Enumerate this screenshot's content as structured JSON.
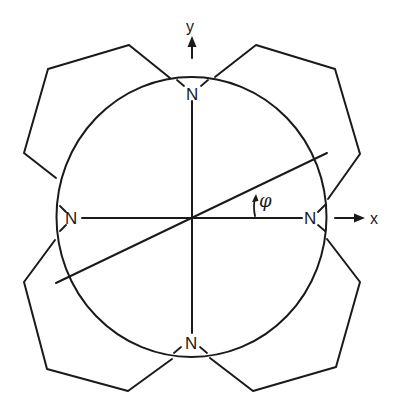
{
  "diagram": {
    "type": "porphyrin-like macrocycle schematic",
    "axes": {
      "x_label": "x",
      "y_label": "y"
    },
    "angle_label": "φ",
    "nitrogen_label": "N",
    "nitrogens": [
      {
        "position": "top",
        "label": "N"
      },
      {
        "position": "left",
        "label": "N"
      },
      {
        "position": "right",
        "label": "N"
      },
      {
        "position": "bottom",
        "label": "N"
      }
    ],
    "rings": [
      {
        "position": "top-left",
        "shape": "pentagon-like ring"
      },
      {
        "position": "top-right",
        "shape": "pentagon-like ring"
      },
      {
        "position": "bottom-left",
        "shape": "pentagon-like ring"
      },
      {
        "position": "bottom-right",
        "shape": "pentagon-like ring"
      }
    ],
    "colors": {
      "stroke": "#1a1a1a",
      "background": "#ffffff"
    }
  }
}
